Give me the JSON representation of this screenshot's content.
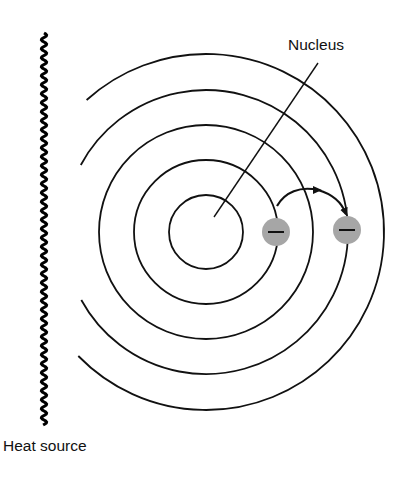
{
  "diagram": {
    "labels": {
      "nucleus": "Nucleus",
      "heat_source": "Heat source"
    },
    "orbits": [
      {
        "level": 1,
        "full_circle": true
      },
      {
        "level": 2,
        "full_circle": true
      },
      {
        "level": 3,
        "full_circle": true
      },
      {
        "level": 4,
        "full_circle": false
      },
      {
        "level": 5,
        "full_circle": false
      }
    ],
    "electrons": [
      {
        "id": "ground",
        "orbit_level": 2,
        "charge_symbol": "minus"
      },
      {
        "id": "excited",
        "orbit_level": 4,
        "charge_symbol": "minus"
      }
    ],
    "transition": {
      "from_level": 2,
      "to_level": 4,
      "direction": "outward"
    },
    "colors": {
      "line": "#111111",
      "electron_fill": "#a6a6a6",
      "background": "#ffffff"
    }
  }
}
